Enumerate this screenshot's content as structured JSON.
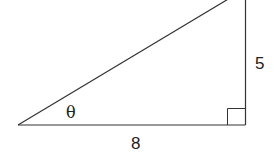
{
  "diagram": {
    "type": "right-triangle",
    "labels": {
      "angle": "θ",
      "base": "8",
      "height": "5"
    },
    "colors": {
      "stroke": "#333333",
      "text": "#222222",
      "background": "#ffffff"
    }
  }
}
